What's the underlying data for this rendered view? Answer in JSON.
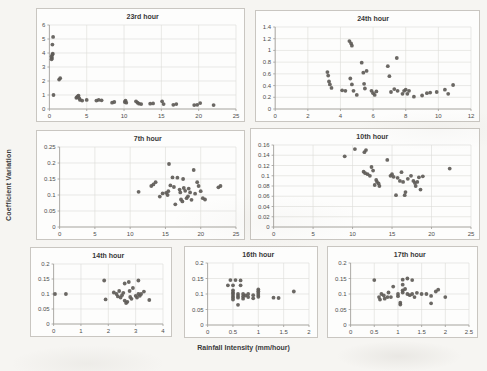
{
  "figure": {
    "y_axis_label": "Coefficient Variation",
    "x_axis_label": "Rainfall Intensity (mm/hour)"
  },
  "colors": {
    "point": "#5e5b57",
    "grid": "#dcdbd7",
    "panel_border": "#c9c6c1",
    "axis": "#9e9c98",
    "tick_text": "#4d4d4d",
    "title_text": "#383838",
    "page_bg": "#f6f5f2",
    "panel_bg": "#fdfdfc"
  },
  "chart_data": [
    {
      "type": "scatter",
      "title": "23rd hour",
      "xlim": [
        0,
        25
      ],
      "ylim": [
        0,
        6
      ],
      "grid": true,
      "legend": false,
      "xticks": [
        0,
        5,
        10,
        15,
        20,
        25
      ],
      "xtick_labels": [
        "0",
        "5",
        "10",
        "15",
        "20",
        "25"
      ],
      "yticks": [
        0,
        1,
        2,
        3,
        4,
        5,
        6
      ],
      "ytick_labels": [
        "0",
        "1",
        "2",
        "3",
        "4",
        "5",
        "6"
      ],
      "points": [
        [
          0.3,
          3.55
        ],
        [
          0.35,
          3.65
        ],
        [
          0.3,
          3.75
        ],
        [
          0.4,
          3.9
        ],
        [
          0.45,
          3.95
        ],
        [
          0.4,
          4.6
        ],
        [
          0.5,
          5.15
        ],
        [
          0.55,
          1.0
        ],
        [
          1.3,
          2.1
        ],
        [
          1.45,
          2.2
        ],
        [
          3.6,
          0.8
        ],
        [
          3.7,
          0.85
        ],
        [
          3.8,
          0.9
        ],
        [
          3.9,
          0.95
        ],
        [
          4.0,
          0.75
        ],
        [
          4.1,
          0.65
        ],
        [
          4.4,
          0.6
        ],
        [
          5.0,
          0.65
        ],
        [
          6.3,
          0.6
        ],
        [
          6.6,
          0.65
        ],
        [
          7.0,
          0.62
        ],
        [
          8.4,
          0.45
        ],
        [
          8.7,
          0.5
        ],
        [
          10.1,
          0.5
        ],
        [
          10.2,
          0.6
        ],
        [
          10.3,
          0.45
        ],
        [
          11.6,
          0.55
        ],
        [
          11.8,
          0.45
        ],
        [
          12.0,
          0.38
        ],
        [
          12.3,
          0.35
        ],
        [
          13.5,
          0.38
        ],
        [
          13.9,
          0.4
        ],
        [
          15.1,
          0.55
        ],
        [
          15.3,
          0.35
        ],
        [
          16.6,
          0.3
        ],
        [
          17.0,
          0.35
        ],
        [
          19.4,
          0.28
        ],
        [
          19.8,
          0.3
        ],
        [
          20.2,
          0.42
        ],
        [
          22.0,
          0.28
        ]
      ]
    },
    {
      "type": "scatter",
      "title": "24th hour",
      "xlim": [
        0,
        12
      ],
      "ylim": [
        0,
        1.4
      ],
      "grid": true,
      "legend": false,
      "xticks": [
        0,
        2,
        4,
        6,
        8,
        10,
        12
      ],
      "xtick_labels": [
        "0",
        "2",
        "4",
        "6",
        "8",
        "10",
        "12"
      ],
      "yticks": [
        0,
        0.2,
        0.4,
        0.6,
        0.8,
        1,
        1.2,
        1.4
      ],
      "ytick_labels": [
        "0",
        "0.2",
        "0.4",
        "0.6",
        "0.8",
        "1",
        "1.2",
        "1.4"
      ],
      "points": [
        [
          3.2,
          0.63
        ],
        [
          3.25,
          0.57
        ],
        [
          3.3,
          0.47
        ],
        [
          3.35,
          0.42
        ],
        [
          3.45,
          0.36
        ],
        [
          4.1,
          0.32
        ],
        [
          4.3,
          0.31
        ],
        [
          4.55,
          1.16
        ],
        [
          4.65,
          1.12
        ],
        [
          4.7,
          1.08
        ],
        [
          4.6,
          0.52
        ],
        [
          4.7,
          0.42
        ],
        [
          4.8,
          0.31
        ],
        [
          5.0,
          0.24
        ],
        [
          5.3,
          0.79
        ],
        [
          5.4,
          0.62
        ],
        [
          5.45,
          0.43
        ],
        [
          5.5,
          0.35
        ],
        [
          5.6,
          0.65
        ],
        [
          5.9,
          0.31
        ],
        [
          6.0,
          0.27
        ],
        [
          6.1,
          0.24
        ],
        [
          6.2,
          0.3
        ],
        [
          6.9,
          0.73
        ],
        [
          7.0,
          0.56
        ],
        [
          7.1,
          0.29
        ],
        [
          7.3,
          0.34
        ],
        [
          7.45,
          0.87
        ],
        [
          7.5,
          0.31
        ],
        [
          7.8,
          0.26
        ],
        [
          7.9,
          0.31
        ],
        [
          8.0,
          0.33
        ],
        [
          8.1,
          0.26
        ],
        [
          8.2,
          0.31
        ],
        [
          8.5,
          0.21
        ],
        [
          9.0,
          0.23
        ],
        [
          9.3,
          0.27
        ],
        [
          9.5,
          0.28
        ],
        [
          9.9,
          0.29
        ],
        [
          10.4,
          0.33
        ],
        [
          10.6,
          0.26
        ],
        [
          10.9,
          0.41
        ]
      ]
    },
    {
      "type": "scatter",
      "title": "7th hour",
      "xlim": [
        0,
        25
      ],
      "ylim": [
        0,
        0.25
      ],
      "grid": true,
      "legend": false,
      "xticks": [
        0,
        5,
        10,
        15,
        20,
        25
      ],
      "xtick_labels": [
        "0",
        "5",
        "10",
        "15",
        "20",
        "25"
      ],
      "yticks": [
        0,
        0.05,
        0.1,
        0.15,
        0.2,
        0.25
      ],
      "ytick_labels": [
        "0",
        "0.05",
        "0.1",
        "0.15",
        "0.2",
        "0.25"
      ],
      "points": [
        [
          11.2,
          0.11
        ],
        [
          13.0,
          0.128
        ],
        [
          13.3,
          0.133
        ],
        [
          13.6,
          0.14
        ],
        [
          14.2,
          0.095
        ],
        [
          14.6,
          0.105
        ],
        [
          15.1,
          0.107
        ],
        [
          15.3,
          0.1
        ],
        [
          15.4,
          0.112
        ],
        [
          15.5,
          0.197
        ],
        [
          15.7,
          0.13
        ],
        [
          16.0,
          0.155
        ],
        [
          16.2,
          0.125
        ],
        [
          16.4,
          0.071
        ],
        [
          16.7,
          0.154
        ],
        [
          17.0,
          0.117
        ],
        [
          17.1,
          0.108
        ],
        [
          17.2,
          0.086
        ],
        [
          17.4,
          0.08
        ],
        [
          17.5,
          0.15
        ],
        [
          17.6,
          0.122
        ],
        [
          17.8,
          0.113
        ],
        [
          18.0,
          0.09
        ],
        [
          18.2,
          0.096
        ],
        [
          18.3,
          0.12
        ],
        [
          18.5,
          0.108
        ],
        [
          18.7,
          0.085
        ],
        [
          19.0,
          0.178
        ],
        [
          19.2,
          0.104
        ],
        [
          19.5,
          0.14
        ],
        [
          19.7,
          0.128
        ],
        [
          20.0,
          0.112
        ],
        [
          20.3,
          0.09
        ],
        [
          20.6,
          0.086
        ],
        [
          22.5,
          0.124
        ],
        [
          22.8,
          0.128
        ]
      ]
    },
    {
      "type": "scatter",
      "title": "10th hour",
      "xlim": [
        0,
        25
      ],
      "ylim": [
        0,
        0.16
      ],
      "grid": true,
      "legend": false,
      "xticks": [
        0,
        5,
        10,
        15,
        20,
        25
      ],
      "xtick_labels": [
        "0",
        "5",
        "10",
        "15",
        "20",
        "25"
      ],
      "yticks": [
        0,
        0.02,
        0.04,
        0.06,
        0.08,
        0.1,
        0.12,
        0.14,
        0.16
      ],
      "ytick_labels": [
        "0",
        "0.02",
        "0.04",
        "0.06",
        "0.08",
        "0.1",
        "0.12",
        "0.14",
        "0.16"
      ],
      "points": [
        [
          9.0,
          0.138
        ],
        [
          10.3,
          0.152
        ],
        [
          11.5,
          0.146
        ],
        [
          11.7,
          0.15
        ],
        [
          11.4,
          0.108
        ],
        [
          11.6,
          0.105
        ],
        [
          11.9,
          0.103
        ],
        [
          12.2,
          0.1
        ],
        [
          12.4,
          0.117
        ],
        [
          12.6,
          0.11
        ],
        [
          12.8,
          0.082
        ],
        [
          13.0,
          0.092
        ],
        [
          13.1,
          0.088
        ],
        [
          13.3,
          0.085
        ],
        [
          13.4,
          0.08
        ],
        [
          14.4,
          0.131
        ],
        [
          14.8,
          0.1
        ],
        [
          15.0,
          0.103
        ],
        [
          15.2,
          0.098
        ],
        [
          15.5,
          0.062
        ],
        [
          15.7,
          0.096
        ],
        [
          16.0,
          0.09
        ],
        [
          16.2,
          0.107
        ],
        [
          16.4,
          0.088
        ],
        [
          16.6,
          0.062
        ],
        [
          16.7,
          0.068
        ],
        [
          17.0,
          0.094
        ],
        [
          17.4,
          0.1
        ],
        [
          17.7,
          0.09
        ],
        [
          17.9,
          0.086
        ],
        [
          18.0,
          0.08
        ],
        [
          18.2,
          0.088
        ],
        [
          18.4,
          0.097
        ],
        [
          18.6,
          0.073
        ],
        [
          18.9,
          0.099
        ],
        [
          22.3,
          0.114
        ]
      ]
    },
    {
      "type": "scatter",
      "title": "14th hour",
      "xlim": [
        0,
        4
      ],
      "ylim": [
        0,
        0.2
      ],
      "grid": true,
      "legend": false,
      "xticks": [
        0,
        1,
        2,
        3,
        4
      ],
      "xtick_labels": [
        "0",
        "1",
        "2",
        "3",
        "4"
      ],
      "yticks": [
        0,
        0.05,
        0.1,
        0.15,
        0.2
      ],
      "ytick_labels": [
        "0",
        "0.05",
        "0.1",
        "0.15",
        "0.2"
      ],
      "points": [
        [
          0.05,
          0.1
        ],
        [
          0.45,
          0.1
        ],
        [
          1.85,
          0.145
        ],
        [
          1.9,
          0.082
        ],
        [
          2.2,
          0.105
        ],
        [
          2.3,
          0.1
        ],
        [
          2.35,
          0.092
        ],
        [
          2.4,
          0.11
        ],
        [
          2.45,
          0.088
        ],
        [
          2.5,
          0.096
        ],
        [
          2.55,
          0.104
        ],
        [
          2.6,
          0.135
        ],
        [
          2.6,
          0.078
        ],
        [
          2.65,
          0.07
        ],
        [
          2.7,
          0.074
        ],
        [
          2.75,
          0.14
        ],
        [
          2.78,
          0.11
        ],
        [
          2.8,
          0.09
        ],
        [
          2.85,
          0.084
        ],
        [
          2.9,
          0.12
        ],
        [
          3.0,
          0.094
        ],
        [
          3.05,
          0.088
        ],
        [
          3.1,
          0.145
        ],
        [
          3.1,
          0.1
        ],
        [
          3.15,
          0.094
        ],
        [
          3.2,
          0.1
        ],
        [
          3.3,
          0.108
        ],
        [
          3.5,
          0.08
        ]
      ]
    },
    {
      "type": "scatter",
      "title": "16th hour",
      "xlim": [
        0,
        2
      ],
      "ylim": [
        0,
        0.2
      ],
      "grid": true,
      "legend": false,
      "xticks": [
        0,
        0.5,
        1,
        1.5,
        2
      ],
      "xtick_labels": [
        "0",
        "0.5",
        "1",
        "1.5",
        "2"
      ],
      "yticks": [
        0,
        0.05,
        0.1,
        0.15,
        0.2
      ],
      "ytick_labels": [
        "0",
        "0.05",
        "0.1",
        "0.15",
        "0.2"
      ],
      "points": [
        [
          0.4,
          0.128
        ],
        [
          0.45,
          0.145
        ],
        [
          0.5,
          0.128
        ],
        [
          0.5,
          0.112
        ],
        [
          0.5,
          0.105
        ],
        [
          0.5,
          0.1
        ],
        [
          0.5,
          0.094
        ],
        [
          0.5,
          0.088
        ],
        [
          0.5,
          0.082
        ],
        [
          0.55,
          0.145
        ],
        [
          0.6,
          0.1
        ],
        [
          0.6,
          0.094
        ],
        [
          0.6,
          0.088
        ],
        [
          0.6,
          0.065
        ],
        [
          0.65,
          0.144
        ],
        [
          0.65,
          0.128
        ],
        [
          0.7,
          0.1
        ],
        [
          0.7,
          0.092
        ],
        [
          0.7,
          0.085
        ],
        [
          0.75,
          0.095
        ],
        [
          0.8,
          0.1
        ],
        [
          0.8,
          0.09
        ],
        [
          0.9,
          0.096
        ],
        [
          0.9,
          0.086
        ],
        [
          1.0,
          0.115
        ],
        [
          1.0,
          0.109
        ],
        [
          1.0,
          0.103
        ],
        [
          1.0,
          0.097
        ],
        [
          1.0,
          0.091
        ],
        [
          1.3,
          0.088
        ],
        [
          1.4,
          0.087
        ],
        [
          1.7,
          0.108
        ]
      ]
    },
    {
      "type": "scatter",
      "title": "17th hour",
      "xlim": [
        0,
        2.5
      ],
      "ylim": [
        0,
        0.2
      ],
      "grid": true,
      "legend": false,
      "xticks": [
        0,
        0.5,
        1,
        1.5,
        2,
        2.5
      ],
      "xtick_labels": [
        "0",
        "0.5",
        "1",
        "1.5",
        "2",
        "2.5"
      ],
      "yticks": [
        0,
        0.05,
        0.1,
        0.15,
        0.2
      ],
      "ytick_labels": [
        "0",
        "0.05",
        "0.1",
        "0.15",
        "0.2"
      ],
      "points": [
        [
          0.5,
          0.145
        ],
        [
          0.6,
          0.09
        ],
        [
          0.62,
          0.082
        ],
        [
          0.65,
          0.1
        ],
        [
          0.7,
          0.095
        ],
        [
          0.72,
          0.085
        ],
        [
          0.78,
          0.09
        ],
        [
          0.8,
          0.105
        ],
        [
          0.85,
          0.09
        ],
        [
          0.9,
          0.124
        ],
        [
          1.0,
          0.1
        ],
        [
          1.0,
          0.093
        ],
        [
          1.05,
          0.066
        ],
        [
          1.05,
          0.072
        ],
        [
          1.1,
          0.146
        ],
        [
          1.1,
          0.13
        ],
        [
          1.1,
          0.112
        ],
        [
          1.1,
          0.105
        ],
        [
          1.15,
          0.116
        ],
        [
          1.2,
          0.15
        ],
        [
          1.2,
          0.1
        ],
        [
          1.25,
          0.096
        ],
        [
          1.3,
          0.145
        ],
        [
          1.3,
          0.1
        ],
        [
          1.35,
          0.09
        ],
        [
          1.4,
          0.104
        ],
        [
          1.5,
          0.1
        ],
        [
          1.6,
          0.1
        ],
        [
          1.7,
          0.094
        ],
        [
          1.7,
          0.07
        ],
        [
          1.8,
          0.108
        ],
        [
          1.85,
          0.114
        ],
        [
          2.0,
          0.09
        ]
      ]
    }
  ]
}
